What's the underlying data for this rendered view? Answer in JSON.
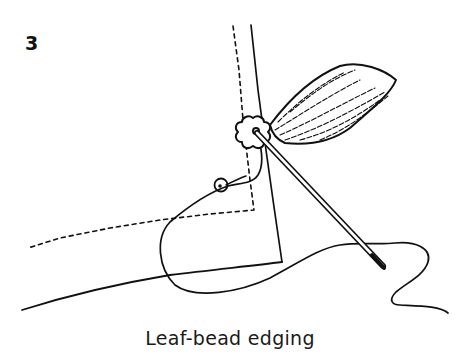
{
  "figure": {
    "step_number": "3",
    "caption": "Leaf-bead edging",
    "elements": [
      "fabric-edge-dotted-guide",
      "fabric-fold-line",
      "flower-bead",
      "leaf-bead",
      "needle",
      "seed-bead",
      "thread"
    ],
    "colors": {
      "ink": "#111111",
      "background": "#ffffff"
    }
  }
}
